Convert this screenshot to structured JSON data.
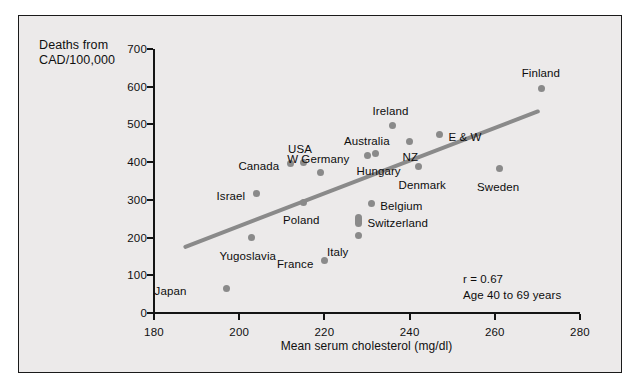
{
  "chart_data": {
    "type": "scatter",
    "title": "",
    "xlabel": "Mean serum cholesterol (mg/dl)",
    "ylabel": "Deaths from\nCAD/100,000",
    "xlim": [
      180,
      280
    ],
    "ylim": [
      0,
      700
    ],
    "xticks": [
      180,
      200,
      220,
      240,
      260,
      280
    ],
    "yticks": [
      0,
      100,
      200,
      300,
      400,
      500,
      600,
      700
    ],
    "grid": false,
    "legend": null,
    "annotations": [
      "r = 0.67",
      "Age 40 to 69 years"
    ],
    "correlation": 0.67,
    "age_range": "Age 40 to 69 years",
    "trendline": {
      "type": "linear",
      "x_start": 187.5,
      "y_start": 172,
      "x_end": 270.5,
      "y_end": 533
    },
    "points": [
      {
        "label": "Japan",
        "x": 197,
        "y": 66,
        "label_dx": -40,
        "label_dy": 4,
        "label_align": "right"
      },
      {
        "label": "Yugoslavia",
        "x": 203,
        "y": 201,
        "label_dx": -4,
        "label_dy": 20,
        "label_align": "center"
      },
      {
        "label": "Israel",
        "x": 204,
        "y": 317,
        "label_dx": -11,
        "label_dy": 4,
        "label_align": "right"
      },
      {
        "label": "Canada",
        "x": 212,
        "y": 397,
        "label_dx": -11,
        "label_dy": 4,
        "label_align": "right"
      },
      {
        "label": "USA",
        "x": 215,
        "y": 399,
        "label_dx": -3,
        "label_dy": -13,
        "label_align": "center"
      },
      {
        "label": "Poland",
        "x": 215,
        "y": 294,
        "label_dx": -2,
        "label_dy": 19,
        "label_align": "center"
      },
      {
        "label": "France",
        "x": 220,
        "y": 138,
        "label_dx": -11,
        "label_dy": 4,
        "label_align": "right"
      },
      {
        "label": "W Germany",
        "x": 219,
        "y": 372,
        "label_dx": -2,
        "label_dy": -13,
        "label_align": "center"
      },
      {
        "label": "Italy",
        "x": 228,
        "y": 206,
        "label_dx": -10,
        "label_dy": 18,
        "label_align": "right"
      },
      {
        "label": "Switzerland",
        "x": 228,
        "y": 246,
        "label_dx": 9,
        "label_dy": 4,
        "label_align": "left"
      },
      {
        "label": "Belgium",
        "x": 231,
        "y": 291,
        "label_dx": 9,
        "label_dy": 4,
        "label_align": "left"
      },
      {
        "label": "Australia",
        "x": 230,
        "y": 418,
        "label_dx": 0,
        "label_dy": -13,
        "label_align": "center"
      },
      {
        "label": "Hungary",
        "x": 232,
        "y": 424,
        "label_dx": 3,
        "label_dy": 19,
        "label_align": "center"
      },
      {
        "label": "Ireland",
        "x": 236,
        "y": 498,
        "label_dx": -2,
        "label_dy": -13,
        "label_align": "center"
      },
      {
        "label": "NZ",
        "x": 240,
        "y": 456,
        "label_dx": 1,
        "label_dy": 17,
        "label_align": "center"
      },
      {
        "label": "Denmark",
        "x": 242,
        "y": 389,
        "label_dx": 4,
        "label_dy": 20,
        "label_align": "center"
      },
      {
        "label": "E & W",
        "x": 247,
        "y": 474,
        "label_dx": 9,
        "label_dy": 4,
        "label_align": "left"
      },
      {
        "label": "Sweden",
        "x": 261,
        "y": 384,
        "label_dx": -1,
        "label_dy": 20,
        "label_align": "center"
      },
      {
        "label": "Finland",
        "x": 271,
        "y": 596,
        "label_dx": -1,
        "label_dy": -14,
        "label_align": "center"
      }
    ]
  },
  "colors": {
    "background": "#ffffff",
    "panel": "#eceaea",
    "border": "#1a1a1a",
    "axis": "#141414",
    "marker": "#8a8a8a",
    "trendline": "#8a8a8a",
    "text": "#0d0d0d"
  }
}
